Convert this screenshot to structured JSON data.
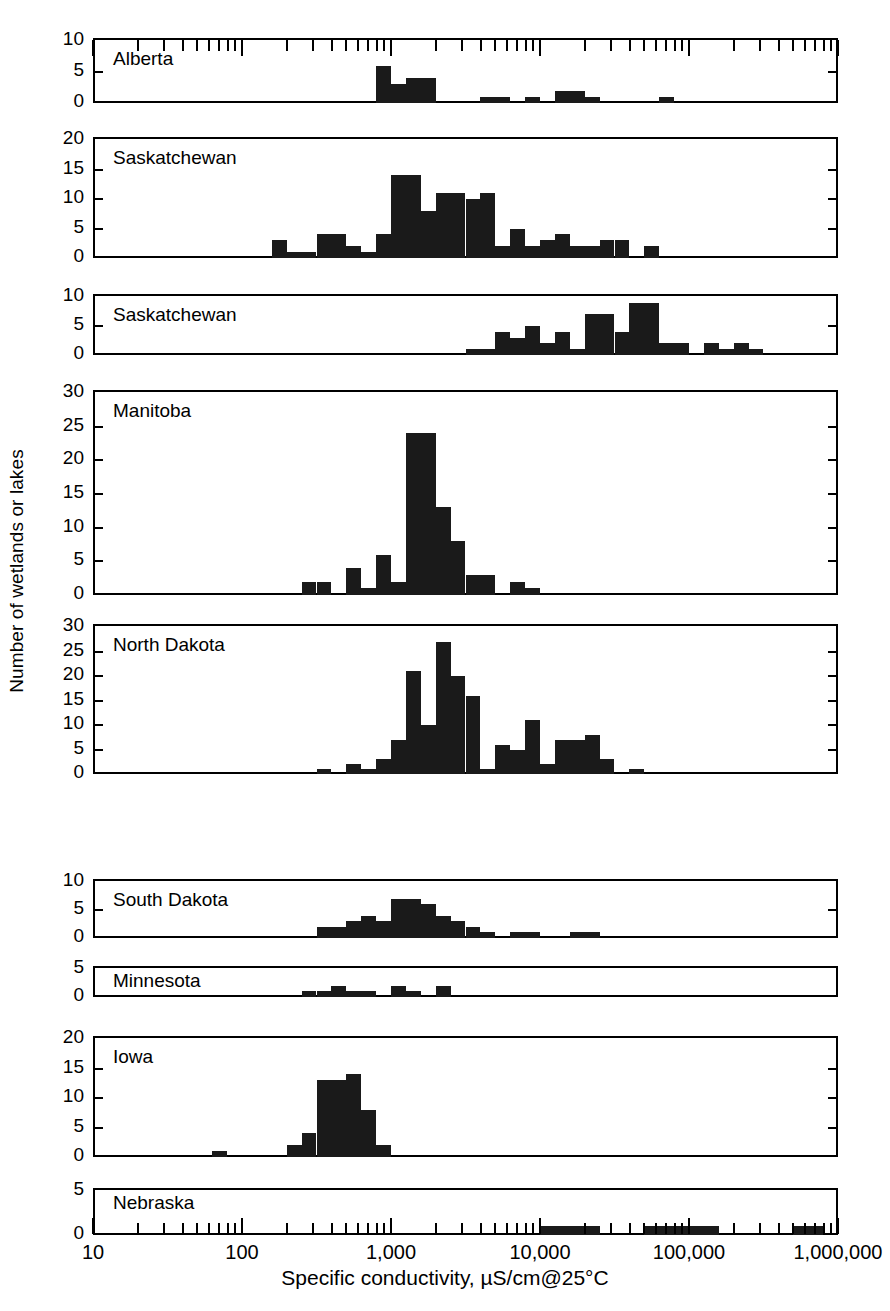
{
  "figure": {
    "ylabel": "Number of wetlands or lakes",
    "xlabel": "Specific conductivity, µS/cm@25°C",
    "bar_color": "#1a1a1a",
    "frame_color": "#000000",
    "background": "#ffffff"
  },
  "chart_data": {
    "type": "bar",
    "title": "",
    "subtitle": "",
    "xlabel": "Specific conductivity, µS/cm@25°C",
    "ylabel": "Number of wetlands or lakes",
    "xscale": "log",
    "xlim": [
      10,
      1000000
    ],
    "xtick_labels": [
      "10",
      "100",
      "1,000",
      "10,000",
      "100,000",
      "1,000,000"
    ],
    "xtick_values": [
      10,
      100,
      1000,
      10000,
      100000,
      1000000
    ],
    "grid": false,
    "legend": "none",
    "bin_width_decades": 0.1,
    "note": "Nine stacked histogram panels, one per region. x is log10 specific conductivity; each bar spans 0.1 decade. bin_start_log10 gives log10 of each bar's left edge.",
    "panels": [
      {
        "name": "Alberta",
        "ylim": [
          0,
          10
        ],
        "yticks": [
          0,
          5,
          10
        ],
        "bins": [
          {
            "bin_start_log10": 2.9,
            "count": 6
          },
          {
            "bin_start_log10": 3.0,
            "count": 3
          },
          {
            "bin_start_log10": 3.1,
            "count": 4
          },
          {
            "bin_start_log10": 3.2,
            "count": 4
          },
          {
            "bin_start_log10": 3.6,
            "count": 1
          },
          {
            "bin_start_log10": 3.7,
            "count": 1
          },
          {
            "bin_start_log10": 3.9,
            "count": 1
          },
          {
            "bin_start_log10": 4.1,
            "count": 2
          },
          {
            "bin_start_log10": 4.2,
            "count": 2
          },
          {
            "bin_start_log10": 4.3,
            "count": 1
          },
          {
            "bin_start_log10": 4.8,
            "count": 1
          }
        ]
      },
      {
        "name": "Saskatchewan",
        "ylim": [
          0,
          20
        ],
        "yticks": [
          0,
          5,
          10,
          15,
          20
        ],
        "bins": [
          {
            "bin_start_log10": 2.2,
            "count": 3
          },
          {
            "bin_start_log10": 2.3,
            "count": 1
          },
          {
            "bin_start_log10": 2.4,
            "count": 1
          },
          {
            "bin_start_log10": 2.5,
            "count": 4
          },
          {
            "bin_start_log10": 2.6,
            "count": 4
          },
          {
            "bin_start_log10": 2.7,
            "count": 2
          },
          {
            "bin_start_log10": 2.8,
            "count": 1
          },
          {
            "bin_start_log10": 2.9,
            "count": 4
          },
          {
            "bin_start_log10": 3.0,
            "count": 14
          },
          {
            "bin_start_log10": 3.1,
            "count": 14
          },
          {
            "bin_start_log10": 3.2,
            "count": 8
          },
          {
            "bin_start_log10": 3.3,
            "count": 11
          },
          {
            "bin_start_log10": 3.4,
            "count": 11
          },
          {
            "bin_start_log10": 3.5,
            "count": 10
          },
          {
            "bin_start_log10": 3.6,
            "count": 11
          },
          {
            "bin_start_log10": 3.7,
            "count": 2
          },
          {
            "bin_start_log10": 3.8,
            "count": 5
          },
          {
            "bin_start_log10": 3.9,
            "count": 2
          },
          {
            "bin_start_log10": 4.0,
            "count": 3
          },
          {
            "bin_start_log10": 4.1,
            "count": 4
          },
          {
            "bin_start_log10": 4.2,
            "count": 2
          },
          {
            "bin_start_log10": 4.3,
            "count": 2
          },
          {
            "bin_start_log10": 4.4,
            "count": 3
          },
          {
            "bin_start_log10": 4.5,
            "count": 3
          },
          {
            "bin_start_log10": 4.7,
            "count": 2
          }
        ]
      },
      {
        "name": "Saskatchewan",
        "ylim": [
          0,
          10
        ],
        "yticks": [
          0,
          5,
          10
        ],
        "bins": [
          {
            "bin_start_log10": 3.5,
            "count": 1
          },
          {
            "bin_start_log10": 3.6,
            "count": 1
          },
          {
            "bin_start_log10": 3.7,
            "count": 4
          },
          {
            "bin_start_log10": 3.8,
            "count": 3
          },
          {
            "bin_start_log10": 3.9,
            "count": 5
          },
          {
            "bin_start_log10": 4.0,
            "count": 2
          },
          {
            "bin_start_log10": 4.1,
            "count": 4
          },
          {
            "bin_start_log10": 4.2,
            "count": 1
          },
          {
            "bin_start_log10": 4.3,
            "count": 7
          },
          {
            "bin_start_log10": 4.4,
            "count": 7
          },
          {
            "bin_start_log10": 4.5,
            "count": 4
          },
          {
            "bin_start_log10": 4.6,
            "count": 9
          },
          {
            "bin_start_log10": 4.7,
            "count": 9
          },
          {
            "bin_start_log10": 4.8,
            "count": 2
          },
          {
            "bin_start_log10": 4.9,
            "count": 2
          },
          {
            "bin_start_log10": 5.1,
            "count": 2
          },
          {
            "bin_start_log10": 5.2,
            "count": 1
          },
          {
            "bin_start_log10": 5.3,
            "count": 2
          },
          {
            "bin_start_log10": 5.4,
            "count": 1
          }
        ]
      },
      {
        "name": "Manitoba",
        "ylim": [
          0,
          30
        ],
        "yticks": [
          0,
          5,
          10,
          15,
          20,
          25,
          30
        ],
        "bins": [
          {
            "bin_start_log10": 2.4,
            "count": 2
          },
          {
            "bin_start_log10": 2.5,
            "count": 2
          },
          {
            "bin_start_log10": 2.7,
            "count": 4
          },
          {
            "bin_start_log10": 2.8,
            "count": 1
          },
          {
            "bin_start_log10": 2.9,
            "count": 6
          },
          {
            "bin_start_log10": 3.0,
            "count": 2
          },
          {
            "bin_start_log10": 3.1,
            "count": 24
          },
          {
            "bin_start_log10": 3.2,
            "count": 24
          },
          {
            "bin_start_log10": 3.3,
            "count": 13
          },
          {
            "bin_start_log10": 3.4,
            "count": 8
          },
          {
            "bin_start_log10": 3.5,
            "count": 3
          },
          {
            "bin_start_log10": 3.6,
            "count": 3
          },
          {
            "bin_start_log10": 3.8,
            "count": 2
          },
          {
            "bin_start_log10": 3.9,
            "count": 1
          }
        ]
      },
      {
        "name": "North Dakota",
        "ylim": [
          0,
          30
        ],
        "yticks": [
          0,
          5,
          10,
          15,
          20,
          25,
          30
        ],
        "bins": [
          {
            "bin_start_log10": 2.5,
            "count": 1
          },
          {
            "bin_start_log10": 2.7,
            "count": 2
          },
          {
            "bin_start_log10": 2.8,
            "count": 1
          },
          {
            "bin_start_log10": 2.9,
            "count": 3
          },
          {
            "bin_start_log10": 3.0,
            "count": 7
          },
          {
            "bin_start_log10": 3.1,
            "count": 21
          },
          {
            "bin_start_log10": 3.2,
            "count": 10
          },
          {
            "bin_start_log10": 3.3,
            "count": 27
          },
          {
            "bin_start_log10": 3.4,
            "count": 20
          },
          {
            "bin_start_log10": 3.5,
            "count": 16
          },
          {
            "bin_start_log10": 3.6,
            "count": 1
          },
          {
            "bin_start_log10": 3.7,
            "count": 6
          },
          {
            "bin_start_log10": 3.8,
            "count": 5
          },
          {
            "bin_start_log10": 3.9,
            "count": 11
          },
          {
            "bin_start_log10": 4.0,
            "count": 2
          },
          {
            "bin_start_log10": 4.1,
            "count": 7
          },
          {
            "bin_start_log10": 4.2,
            "count": 7
          },
          {
            "bin_start_log10": 4.3,
            "count": 8
          },
          {
            "bin_start_log10": 4.4,
            "count": 3
          },
          {
            "bin_start_log10": 4.6,
            "count": 1
          }
        ]
      },
      {
        "name": "South Dakota",
        "ylim": [
          0,
          10
        ],
        "yticks": [
          0,
          5,
          10
        ],
        "bins": [
          {
            "bin_start_log10": 2.5,
            "count": 2
          },
          {
            "bin_start_log10": 2.6,
            "count": 2
          },
          {
            "bin_start_log10": 2.7,
            "count": 3
          },
          {
            "bin_start_log10": 2.8,
            "count": 4
          },
          {
            "bin_start_log10": 2.9,
            "count": 3
          },
          {
            "bin_start_log10": 3.0,
            "count": 7
          },
          {
            "bin_start_log10": 3.1,
            "count": 7
          },
          {
            "bin_start_log10": 3.2,
            "count": 6
          },
          {
            "bin_start_log10": 3.3,
            "count": 4
          },
          {
            "bin_start_log10": 3.4,
            "count": 3
          },
          {
            "bin_start_log10": 3.5,
            "count": 2
          },
          {
            "bin_start_log10": 3.6,
            "count": 1
          },
          {
            "bin_start_log10": 3.8,
            "count": 1
          },
          {
            "bin_start_log10": 3.9,
            "count": 1
          },
          {
            "bin_start_log10": 4.2,
            "count": 1
          },
          {
            "bin_start_log10": 4.3,
            "count": 1
          }
        ]
      },
      {
        "name": "Minnesota",
        "ylim": [
          0,
          5
        ],
        "yticks": [
          0,
          5
        ],
        "bins": [
          {
            "bin_start_log10": 2.4,
            "count": 1
          },
          {
            "bin_start_log10": 2.5,
            "count": 1
          },
          {
            "bin_start_log10": 2.6,
            "count": 2
          },
          {
            "bin_start_log10": 2.7,
            "count": 1
          },
          {
            "bin_start_log10": 2.8,
            "count": 1
          },
          {
            "bin_start_log10": 3.0,
            "count": 2
          },
          {
            "bin_start_log10": 3.1,
            "count": 1
          },
          {
            "bin_start_log10": 3.3,
            "count": 2
          }
        ]
      },
      {
        "name": "Iowa",
        "ylim": [
          0,
          20
        ],
        "yticks": [
          0,
          5,
          10,
          15,
          20
        ],
        "bins": [
          {
            "bin_start_log10": 1.8,
            "count": 1
          },
          {
            "bin_start_log10": 2.3,
            "count": 2
          },
          {
            "bin_start_log10": 2.4,
            "count": 4
          },
          {
            "bin_start_log10": 2.5,
            "count": 13
          },
          {
            "bin_start_log10": 2.6,
            "count": 13
          },
          {
            "bin_start_log10": 2.7,
            "count": 14
          },
          {
            "bin_start_log10": 2.8,
            "count": 8
          },
          {
            "bin_start_log10": 2.9,
            "count": 2
          }
        ]
      },
      {
        "name": "Nebraska",
        "ylim": [
          0,
          5
        ],
        "yticks": [
          0,
          5
        ],
        "bins": [
          {
            "bin_start_log10": 4.0,
            "count": 1
          },
          {
            "bin_start_log10": 4.1,
            "count": 1
          },
          {
            "bin_start_log10": 4.2,
            "count": 1
          },
          {
            "bin_start_log10": 4.3,
            "count": 1
          },
          {
            "bin_start_log10": 4.7,
            "count": 1
          },
          {
            "bin_start_log10": 4.8,
            "count": 1
          },
          {
            "bin_start_log10": 4.9,
            "count": 1
          },
          {
            "bin_start_log10": 5.0,
            "count": 1
          },
          {
            "bin_start_log10": 5.1,
            "count": 1
          },
          {
            "bin_start_log10": 5.7,
            "count": 1
          },
          {
            "bin_start_log10": 5.8,
            "count": 1
          }
        ]
      }
    ]
  },
  "layout": {
    "plot_left": 93,
    "plot_right": 838,
    "panel_tops": [
      38,
      137,
      294,
      390,
      624,
      879,
      966,
      1036,
      1188
    ],
    "panel_bottoms": [
      103,
      258,
      355,
      595,
      774,
      938,
      997,
      1157,
      1235
    ]
  }
}
